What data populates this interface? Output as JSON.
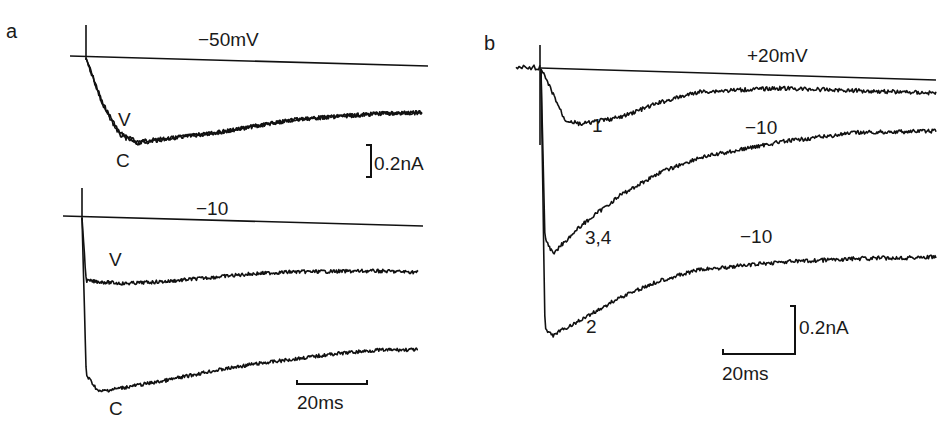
{
  "page_number_fragment": "",
  "panels": {
    "a": {
      "letter": "a",
      "top": {
        "voltage_label": "−50mV",
        "trace_labels": {
          "V": "V",
          "C": "C"
        }
      },
      "bottom": {
        "voltage_label": "−10",
        "trace_labels": {
          "V": "V",
          "C": "C"
        }
      },
      "scale_current": "0.2nA",
      "scale_time": "20ms"
    },
    "b": {
      "letter": "b",
      "voltage_label": "+20mV",
      "trace_labels": {
        "t1": "1",
        "t34": "3,4",
        "t2": "2"
      },
      "step_labels": {
        "s1": "−10",
        "s2": "−10"
      },
      "scale_current": "0.2nA",
      "scale_time": "20ms"
    }
  },
  "chart_data": [
    {
      "type": "line",
      "title": "a (−50mV)",
      "xlabel": "time (ms)",
      "ylabel": "current (nA)",
      "scale_bars": {
        "current": "0.2nA",
        "time": "20ms"
      },
      "series": [
        {
          "name": "V",
          "x": [
            0,
            4,
            8,
            12,
            20,
            30,
            40,
            50,
            60,
            70,
            80
          ],
          "values": [
            0,
            -0.22,
            -0.36,
            -0.4,
            -0.38,
            -0.35,
            -0.31,
            -0.27,
            -0.25,
            -0.23,
            -0.22
          ]
        },
        {
          "name": "C",
          "x": [
            0,
            4,
            8,
            12,
            20,
            30,
            40,
            50,
            60,
            70,
            80
          ],
          "values": [
            0,
            -0.23,
            -0.37,
            -0.41,
            -0.38,
            -0.35,
            -0.31,
            -0.27,
            -0.25,
            -0.23,
            -0.22
          ]
        }
      ]
    },
    {
      "type": "line",
      "title": "a (−10)",
      "xlabel": "time (ms)",
      "ylabel": "current (nA)",
      "scale_bars": {
        "current": "0.2nA",
        "time": "20ms"
      },
      "series": [
        {
          "name": "V",
          "x": [
            0,
            1,
            10,
            20,
            30,
            40,
            50,
            60,
            70,
            80
          ],
          "values": [
            0,
            -0.38,
            -0.39,
            -0.37,
            -0.34,
            -0.31,
            -0.29,
            -0.28,
            -0.27,
            -0.27
          ]
        },
        {
          "name": "C",
          "x": [
            0,
            1,
            4,
            10,
            20,
            30,
            40,
            50,
            60,
            70,
            80
          ],
          "values": [
            0,
            -0.95,
            -1.05,
            -1.02,
            -0.97,
            -0.91,
            -0.86,
            -0.82,
            -0.78,
            -0.75,
            -0.74
          ]
        }
      ]
    },
    {
      "type": "line",
      "title": "b (+20mV, then −10)",
      "xlabel": "time (ms)",
      "ylabel": "current (nA)",
      "scale_bars": {
        "current": "0.2nA",
        "time": "20ms"
      },
      "series": [
        {
          "name": "1",
          "x": [
            0,
            3,
            6,
            10,
            20,
            30,
            40,
            60,
            80,
            100
          ],
          "values": [
            0,
            -0.12,
            -0.25,
            -0.27,
            -0.23,
            -0.15,
            -0.09,
            -0.06,
            -0.06,
            -0.06
          ]
        },
        {
          "name": "3,4",
          "x": [
            0,
            1,
            3,
            10,
            20,
            30,
            40,
            60,
            80,
            100
          ],
          "values": [
            0,
            -0.85,
            -0.92,
            -0.78,
            -0.62,
            -0.5,
            -0.42,
            -0.33,
            -0.27,
            -0.25
          ]
        },
        {
          "name": "2",
          "x": [
            0,
            1,
            3,
            10,
            20,
            30,
            40,
            60,
            80,
            100
          ],
          "values": [
            0,
            -1.3,
            -1.33,
            -1.25,
            -1.13,
            -1.04,
            -0.98,
            -0.93,
            -0.9,
            -0.88
          ]
        }
      ]
    }
  ]
}
